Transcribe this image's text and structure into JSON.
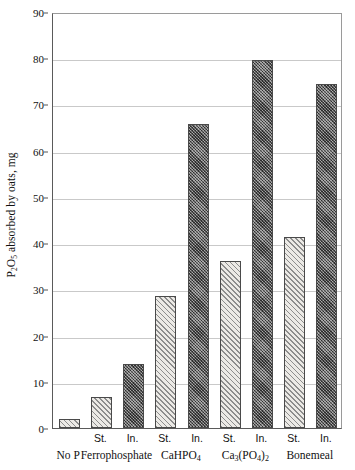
{
  "chart_data": {
    "type": "bar",
    "title": "",
    "xlabel": "",
    "ylabel": "P2O5 absorbed by oats, mg",
    "ylabel_html": "P<sub>2</sub>O<sub>5</sub> absorbed by oats, mg",
    "ylim": [
      0,
      90
    ],
    "ytick_labels": [
      "0",
      "10",
      "20",
      "30",
      "40",
      "50",
      "60",
      "70",
      "80",
      "90"
    ],
    "ytick_values": [
      0,
      10,
      20,
      30,
      40,
      50,
      60,
      70,
      80,
      90
    ],
    "grid": true,
    "legend": "none",
    "categories": [
      "No P",
      "Ferrophosphate",
      "CaHPO4",
      "Ca3(PO4)2",
      "Bonemeal"
    ],
    "category_labels_html": [
      "No P",
      "Ferrophosphate",
      "CaHPO<sub>4</sub>",
      "Ca<sub>3</sub>(PO<sub>4</sub>)<sub>2</sub>",
      "Bonemeal"
    ],
    "series": [
      {
        "name": "St.",
        "fill": "light-diagonal-hatch",
        "color": "#eceae6",
        "values": [
          2.0,
          6.7,
          28.6,
          36.2,
          41.3
        ]
      },
      {
        "name": "In.",
        "fill": "dark-check",
        "color": "#6f6f6f",
        "values": [
          null,
          13.9,
          65.7,
          79.7,
          74.5
        ]
      }
    ],
    "bars": [
      {
        "group": "No P",
        "series": "St.",
        "sublabel": "",
        "value": 2.0
      },
      {
        "group": "Ferrophosphate",
        "series": "St.",
        "sublabel": "St.",
        "value": 6.7
      },
      {
        "group": "Ferrophosphate",
        "series": "In.",
        "sublabel": "In.",
        "value": 13.9
      },
      {
        "group": "CaHPO4",
        "series": "St.",
        "sublabel": "St.",
        "value": 28.6
      },
      {
        "group": "CaHPO4",
        "series": "In.",
        "sublabel": "In.",
        "value": 65.7
      },
      {
        "group": "Ca3(PO4)2",
        "series": "St.",
        "sublabel": "St.",
        "value": 36.2
      },
      {
        "group": "Ca3(PO4)2",
        "series": "In.",
        "sublabel": "In.",
        "value": 79.7
      },
      {
        "group": "Bonemeal",
        "series": "St.",
        "sublabel": "St.",
        "value": 41.3
      },
      {
        "group": "Bonemeal",
        "series": "In.",
        "sublabel": "In.",
        "value": 74.5
      }
    ]
  },
  "axis": {
    "y_title": "P2O5 absorbed by oats, mg"
  },
  "colors": {
    "grid": "#c9c9c9",
    "axis": "#5a5a5a",
    "series_st": "#eceae6",
    "series_in": "#6f6f6f",
    "background": "#ffffff"
  }
}
